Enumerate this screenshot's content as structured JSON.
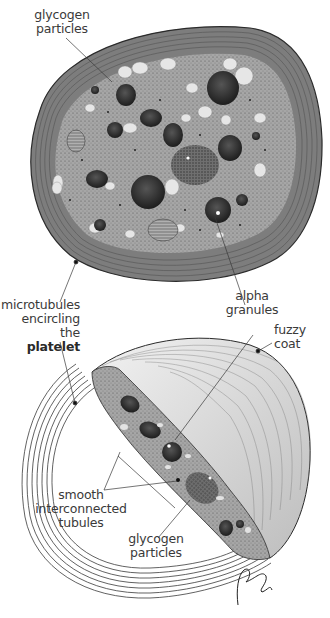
{
  "figure": {
    "type": "anatomical illustration"
  },
  "labels": {
    "glycogen_top": {
      "line1": "glycogen",
      "line2": "particles"
    },
    "microtubules": {
      "line1": "microtubules",
      "line2": "encircling the",
      "line3": "platelet"
    },
    "alpha_granules": {
      "line1": "alpha",
      "line2": "granules"
    },
    "fuzzy_coat": {
      "line1": "fuzzy",
      "line2": "coat"
    },
    "smooth_tubules": {
      "line1": "smooth",
      "line2": "interconnected",
      "line3": "tubules"
    },
    "glycogen_bottom": {
      "line1": "glycogen",
      "line2": "particles"
    }
  },
  "colors": {
    "ink": "#2b2b2b",
    "cytoplasm": "#9a9a9a",
    "granule": "#3a3a3a",
    "vacuole": "#e8e8e8",
    "coat": "#d6d6d6",
    "text": "#3a3a3a"
  }
}
